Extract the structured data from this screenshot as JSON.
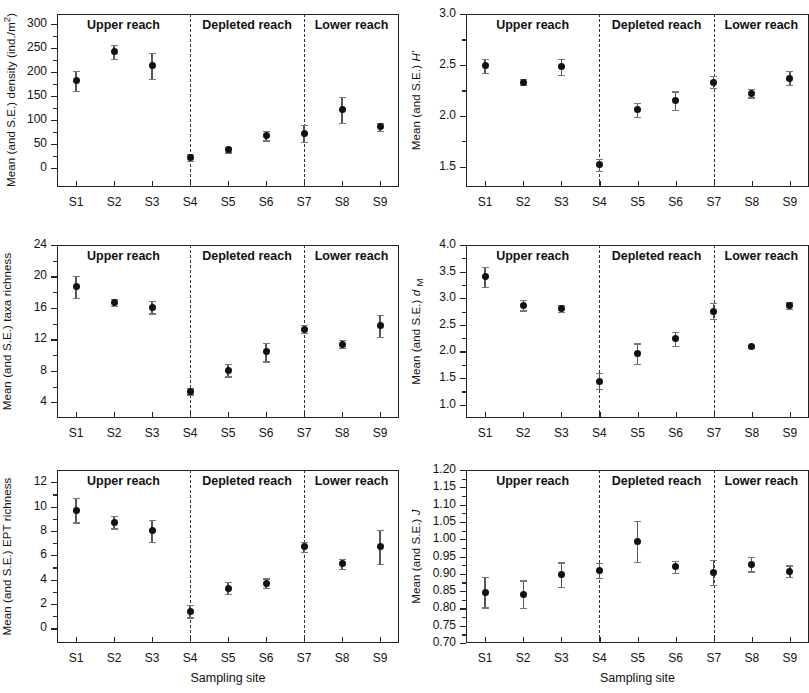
{
  "figure": {
    "xlabel": "Sampling site",
    "sites": [
      "S1",
      "S2",
      "S3",
      "S4",
      "S5",
      "S6",
      "S7",
      "S8",
      "S9"
    ],
    "reaches": [
      "Upper reach",
      "Depleted reach",
      "Lower reach"
    ]
  },
  "chart_data": [
    {
      "id": "density",
      "type": "scatter",
      "title": "",
      "ylabel": "Mean (and S.E.) density (ind./m²)",
      "ylabel_html": "Mean (and S.E.) density (ind./m<sup>2</sup>)",
      "xlabel": "",
      "categories": [
        "S1",
        "S2",
        "S3",
        "S4",
        "S5",
        "S6",
        "S7",
        "S8",
        "S9"
      ],
      "values": [
        181,
        241,
        212,
        22,
        38,
        67,
        72,
        121,
        85
      ],
      "errors": [
        21,
        15,
        27,
        7,
        6,
        10,
        18,
        27,
        9
      ],
      "ylim": [
        -40,
        320
      ],
      "yticks": [
        0,
        50,
        100,
        150,
        200,
        250,
        300
      ],
      "ytick_labels": [
        "0",
        "50",
        "100",
        "150",
        "200",
        "250",
        "300"
      ],
      "grid": false,
      "group_labels": [
        "Upper reach",
        "Depleted reach",
        "Lower reach"
      ],
      "group_dividers": [
        3.5,
        6.5
      ]
    },
    {
      "id": "shannon",
      "type": "scatter",
      "title": "",
      "ylabel": "Mean (and S.E.) H'",
      "ylabel_html": "Mean (and S.E.) <i>H'</i>",
      "xlabel": "",
      "categories": [
        "S1",
        "S2",
        "S3",
        "S4",
        "S5",
        "S6",
        "S7",
        "S8",
        "S9"
      ],
      "values": [
        2.49,
        2.33,
        2.48,
        1.52,
        2.06,
        2.15,
        2.33,
        2.22,
        2.37
      ],
      "errors": [
        0.07,
        0.03,
        0.08,
        0.06,
        0.07,
        0.09,
        0.06,
        0.04,
        0.07
      ],
      "ylim": [
        1.3,
        3.0
      ],
      "yticks": [
        1.5,
        2.0,
        2.5,
        3.0
      ],
      "ytick_labels": [
        "1.5",
        "2.0",
        "2.5",
        "3.0"
      ],
      "grid": false,
      "group_labels": [
        "Upper reach",
        "Depleted reach",
        "Lower reach"
      ],
      "group_dividers": [
        3.5,
        6.5
      ]
    },
    {
      "id": "taxa-richness",
      "type": "scatter",
      "title": "",
      "ylabel": "Mean (and S.E.) taxa richness",
      "ylabel_html": "Mean (and S.E.) taxa richness",
      "xlabel": "",
      "categories": [
        "S1",
        "S2",
        "S3",
        "S4",
        "S5",
        "S6",
        "S7",
        "S8",
        "S9"
      ],
      "values": [
        18.7,
        16.7,
        16.1,
        5.4,
        8.1,
        10.4,
        13.3,
        11.4,
        13.7
      ],
      "errors": [
        1.4,
        0.4,
        0.8,
        0.4,
        0.8,
        1.2,
        0.5,
        0.5,
        1.4
      ],
      "ylim": [
        2.0,
        24.0
      ],
      "yticks": [
        4,
        8,
        12,
        16,
        20,
        24
      ],
      "ytick_labels": [
        "4",
        "8",
        "12",
        "16",
        "20",
        "24"
      ],
      "grid": false,
      "group_labels": [
        "Upper reach",
        "Depleted reach",
        "Lower reach"
      ],
      "group_dividers": [
        3.5,
        6.5
      ]
    },
    {
      "id": "margalef",
      "type": "scatter",
      "title": "",
      "ylabel": "Mean (and S.E.) d M",
      "ylabel_html": "Mean (and S.E.) <i>d</i> <sub>M</sub>",
      "xlabel": "",
      "categories": [
        "S1",
        "S2",
        "S3",
        "S4",
        "S5",
        "S6",
        "S7",
        "S8",
        "S9"
      ],
      "values": [
        3.4,
        2.87,
        2.81,
        1.44,
        1.96,
        2.24,
        2.76,
        2.1,
        2.86
      ],
      "errors": [
        0.19,
        0.1,
        0.06,
        0.15,
        0.19,
        0.13,
        0.15,
        0.03,
        0.06
      ],
      "ylim": [
        0.75,
        4.0
      ],
      "yticks": [
        1.0,
        1.5,
        2.0,
        2.5,
        3.0,
        3.5,
        4.0
      ],
      "ytick_labels": [
        "1.0",
        "1.5",
        "2.0",
        "2.5",
        "3.0",
        "3.5",
        "4.0"
      ],
      "grid": false,
      "group_labels": [
        "Upper reach",
        "Depleted reach",
        "Lower reach"
      ],
      "group_dividers": [
        3.5,
        6.5
      ]
    },
    {
      "id": "ept-richness",
      "type": "scatter",
      "title": "",
      "ylabel": "Mean (and S.E.) EPT richness",
      "ylabel_html": "Mean (and S.E.) EPT richness",
      "xlabel": "Sampling site",
      "categories": [
        "S1",
        "S2",
        "S3",
        "S4",
        "S5",
        "S6",
        "S7",
        "S8",
        "S9"
      ],
      "values": [
        9.7,
        8.7,
        8.0,
        1.4,
        3.3,
        3.7,
        6.7,
        5.3,
        6.7
      ],
      "errors": [
        1.0,
        0.5,
        0.9,
        0.5,
        0.5,
        0.4,
        0.4,
        0.4,
        1.4
      ],
      "ylim": [
        -1.2,
        13.0
      ],
      "yticks": [
        0,
        2,
        4,
        6,
        8,
        10,
        12
      ],
      "ytick_labels": [
        "0",
        "2",
        "4",
        "6",
        "8",
        "10",
        "12"
      ],
      "grid": false,
      "group_labels": [
        "Upper reach",
        "Depleted reach",
        "Lower reach"
      ],
      "group_dividers": [
        3.5,
        6.5
      ]
    },
    {
      "id": "evenness",
      "type": "scatter",
      "title": "",
      "ylabel": "Mean (and S.E.) J",
      "ylabel_html": "Mean (and S.E.) <i>J</i>",
      "xlabel": "Sampling site",
      "categories": [
        "S1",
        "S2",
        "S3",
        "S4",
        "S5",
        "S6",
        "S7",
        "S8",
        "S9"
      ],
      "values": [
        0.847,
        0.841,
        0.897,
        0.91,
        0.993,
        0.92,
        0.904,
        0.928,
        0.907
      ],
      "errors": [
        0.044,
        0.04,
        0.036,
        0.021,
        0.059,
        0.018,
        0.037,
        0.021,
        0.017
      ],
      "ylim": [
        0.7,
        1.2
      ],
      "yticks": [
        0.7,
        0.75,
        0.8,
        0.85,
        0.9,
        0.95,
        1.0,
        1.05,
        1.1,
        1.15,
        1.2
      ],
      "ytick_labels": [
        "0.70",
        "0.75",
        "0.80",
        "0.85",
        "0.90",
        "0.95",
        "1.00",
        "1.05",
        "1.10",
        "1.15",
        "1.20"
      ],
      "grid": false,
      "group_labels": [
        "Upper reach",
        "Depleted reach",
        "Lower reach"
      ],
      "group_dividers": [
        3.5,
        6.5
      ]
    }
  ]
}
